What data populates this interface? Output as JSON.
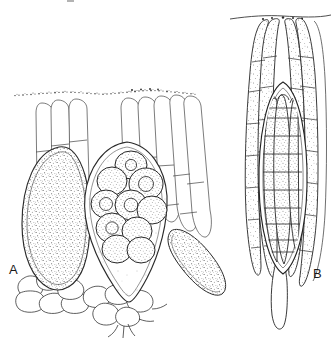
{
  "figure": {
    "kind": "scientific-line-illustration",
    "background_color": "#ffffff",
    "ink_color": "#1a1a1a",
    "stipple_color": "#4a4a4a",
    "line_color_light": "#555555",
    "canvas": {
      "width": 335,
      "height": 340
    },
    "panels": [
      {
        "id": "A",
        "label": "A",
        "label_position": {
          "x": 9,
          "y": 263
        },
        "description": "Vertical section of hymenium showing three asci and clusters of filiform paraphyses arising from basal cells, beneath a granular epithecium line",
        "elements": [
          {
            "name": "epithecium-line",
            "type": "granular-wavy-line",
            "x_start": 14,
            "x_end": 197,
            "y": 92,
            "dot_count": 150
          },
          {
            "name": "ascus-left",
            "type": "ascus",
            "shape": "elongate-oval",
            "fill": "dense-stipple",
            "contents": "undifferentiated",
            "spore_count": 0
          },
          {
            "name": "ascus-center",
            "type": "ascus",
            "shape": "teardrop-pointed-base",
            "fill": "light-stipple",
            "contents": "globose ascospores",
            "spore_count": 10
          },
          {
            "name": "ascus-right-oblique",
            "type": "ascus",
            "shape": "clavate-oblique",
            "fill": "dense-stipple",
            "contents": "undifferentiated",
            "spore_count": 0
          },
          {
            "name": "paraphyses-cluster-left",
            "type": "paraphyses",
            "filament_count": 3,
            "septate": true
          },
          {
            "name": "paraphyses-cluster-right",
            "type": "paraphyses",
            "filament_count": 5,
            "septate": true
          },
          {
            "name": "basal-cells",
            "type": "hyphal-cell-tissue",
            "cell_count": 11
          }
        ]
      },
      {
        "id": "B",
        "label": "B",
        "label_position": {
          "x": 313,
          "y": 267
        },
        "description": "Single ascus containing elongate multi-septate ascospores, flanked by stippled septate paraphyses attached to an upper surface line, base tapering to a stalk",
        "elements": [
          {
            "name": "surface-line",
            "type": "thin-line",
            "x_start": 230,
            "x_end": 331,
            "y": 17
          },
          {
            "name": "ascus-central",
            "type": "ascus",
            "shape": "fusiform",
            "fill": "light",
            "contents": "elongate multi-septate ascospores",
            "spore_count": 4,
            "septa_per_spore": 11
          },
          {
            "name": "paraphyses-left",
            "type": "paraphyses",
            "filament_count": 2,
            "septate": true,
            "fill": "stipple"
          },
          {
            "name": "paraphyses-right",
            "type": "paraphyses",
            "filament_count": 3,
            "septate": true,
            "fill": "stipple"
          },
          {
            "name": "ascus-stalk",
            "type": "tapering-stalk"
          }
        ]
      }
    ]
  }
}
